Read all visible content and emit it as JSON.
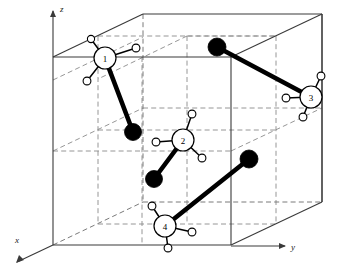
{
  "figure": {
    "kind": "crystal-unit-cell-diagram",
    "title": "",
    "background_color": "#ffffff"
  },
  "colors": {
    "solid_edge": "#3a3a3a",
    "hidden_edge": "#7a7a7a",
    "grid_line": "#8a8a8a",
    "bond": "#000000",
    "heavy_atom_fill": "#000000",
    "light_atom_fill": "#ffffff",
    "atom_stroke": "#000000",
    "axis": "#3a3a3a",
    "text": "#000000"
  },
  "axes": [
    {
      "name": "z-axis",
      "label": "z",
      "label_x": 60,
      "label_y": 12,
      "line": {
        "x1": 53,
        "y1": 57,
        "x2": 53,
        "y2": 11
      },
      "arrow": "up"
    },
    {
      "name": "y-axis",
      "label": "y",
      "label_x": 291,
      "label_y": 250,
      "line": {
        "x1": 231,
        "y1": 246,
        "x2": 285,
        "y2": 246
      },
      "arrow": "right"
    },
    {
      "name": "x-axis",
      "label": "x",
      "label_x": 15,
      "label_y": 243,
      "line": {
        "x1": 53,
        "y1": 245,
        "x2": 17,
        "y2": 262
      },
      "arrow": "down-left"
    }
  ],
  "cell": {
    "vertices": {
      "top_front_left": [
        53,
        57
      ],
      "top_front_right": [
        231,
        57
      ],
      "top_back_left": [
        143,
        14
      ],
      "top_back_right": [
        322,
        14
      ],
      "bottom_front_left": [
        53,
        245
      ],
      "bottom_front_right": [
        231,
        245
      ],
      "bottom_back_left": [
        143,
        202
      ],
      "bottom_back_right": [
        322,
        202
      ]
    },
    "solid_edges": [
      [
        [
          53,
          57
        ],
        [
          231,
          57
        ]
      ],
      [
        [
          53,
          57
        ],
        [
          143,
          14
        ]
      ],
      [
        [
          143,
          14
        ],
        [
          322,
          14
        ]
      ],
      [
        [
          231,
          57
        ],
        [
          322,
          14
        ]
      ],
      [
        [
          53,
          57
        ],
        [
          53,
          245
        ]
      ],
      [
        [
          231,
          57
        ],
        [
          231,
          245
        ]
      ],
      [
        [
          322,
          14
        ],
        [
          322,
          202
        ]
      ],
      [
        [
          53,
          245
        ],
        [
          231,
          245
        ]
      ],
      [
        [
          231,
          245
        ],
        [
          322,
          202
        ]
      ],
      [
        [
          322,
          202
        ],
        [
          322,
          14
        ]
      ]
    ],
    "hidden_edges": [
      [
        [
          53,
          245
        ],
        [
          143,
          202
        ]
      ],
      [
        [
          143,
          202
        ],
        [
          322,
          202
        ]
      ],
      [
        [
          143,
          14
        ],
        [
          143,
          202
        ]
      ]
    ],
    "grid_lines": [
      [
        [
          98,
          36
        ],
        [
          276,
          36
        ]
      ],
      [
        [
          98,
          36
        ],
        [
          98,
          224
        ]
      ],
      [
        [
          187,
          36
        ],
        [
          187,
          224
        ]
      ],
      [
        [
          98,
          224
        ],
        [
          276,
          224
        ]
      ],
      [
        [
          187,
          36
        ],
        [
          276,
          36
        ]
      ],
      [
        [
          276,
          36
        ],
        [
          276,
          224
        ]
      ],
      [
        [
          53,
          151
        ],
        [
          231,
          151
        ]
      ],
      [
        [
          143,
          108
        ],
        [
          322,
          108
        ]
      ],
      [
        [
          53,
          151
        ],
        [
          143,
          108
        ]
      ],
      [
        [
          231,
          151
        ],
        [
          322,
          108
        ]
      ],
      [
        [
          98,
          130
        ],
        [
          276,
          130
        ]
      ],
      [
        [
          142,
          57
        ],
        [
          142,
          245
        ]
      ],
      [
        [
          53,
          80
        ],
        [
          143,
          37
        ]
      ],
      [
        [
          187,
          36
        ],
        [
          98,
          79
        ]
      ]
    ]
  },
  "molecules": [
    {
      "id": "molecule-1",
      "label": "1",
      "center": [
        105,
        58
      ],
      "radius": 11,
      "hydrogens": [
        {
          "name": "hydrogen",
          "cx": 91,
          "cy": 39,
          "r": 3.6
        },
        {
          "name": "hydrogen",
          "cx": 136,
          "cy": 48,
          "r": 3.9
        },
        {
          "name": "hydrogen",
          "cx": 87,
          "cy": 81,
          "r": 3.9
        }
      ],
      "heavy_atom": {
        "name": "heavy-atom",
        "cx": 133,
        "cy": 132,
        "r": 8.5
      }
    },
    {
      "id": "molecule-2",
      "label": "2",
      "center": [
        183,
        140
      ],
      "radius": 11,
      "hydrogens": [
        {
          "name": "hydrogen",
          "cx": 192,
          "cy": 114,
          "r": 3.9
        },
        {
          "name": "hydrogen",
          "cx": 156,
          "cy": 142,
          "r": 3.9
        },
        {
          "name": "hydrogen",
          "cx": 202,
          "cy": 158,
          "r": 3.9
        }
      ],
      "heavy_atom": {
        "name": "heavy-atom",
        "cx": 154,
        "cy": 179,
        "r": 8.5
      }
    },
    {
      "id": "molecule-3",
      "label": "3",
      "center": [
        311,
        97
      ],
      "radius": 11,
      "hydrogens": [
        {
          "name": "hydrogen",
          "cx": 321,
          "cy": 76,
          "r": 3.9
        },
        {
          "name": "hydrogen",
          "cx": 286,
          "cy": 98,
          "r": 3.9
        },
        {
          "name": "hydrogen",
          "cx": 303,
          "cy": 117,
          "r": 3.9
        }
      ],
      "heavy_atom": {
        "name": "heavy-atom",
        "cx": 217,
        "cy": 47,
        "r": 9
      }
    },
    {
      "id": "molecule-4",
      "label": "4",
      "center": [
        165,
        226
      ],
      "radius": 11,
      "hydrogens": [
        {
          "name": "hydrogen",
          "cx": 152,
          "cy": 206,
          "r": 3.9
        },
        {
          "name": "hydrogen",
          "cx": 192,
          "cy": 232,
          "r": 3.9
        },
        {
          "name": "hydrogen",
          "cx": 168,
          "cy": 248,
          "r": 3.9
        }
      ],
      "heavy_atom": {
        "name": "heavy-atom",
        "cx": 249,
        "cy": 159,
        "r": 9
      }
    }
  ]
}
